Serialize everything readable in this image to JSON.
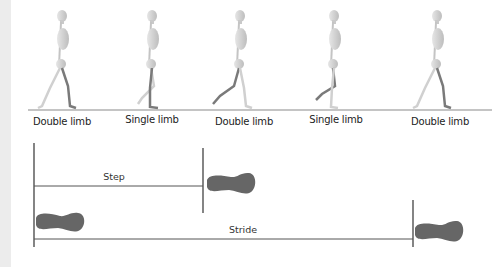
{
  "diagram": {
    "phases": [
      {
        "label": "Double limb",
        "x": 62
      },
      {
        "label": "Single limb",
        "x": 152
      },
      {
        "label": "Double limb",
        "x": 244
      },
      {
        "label": "Single limb",
        "x": 336
      },
      {
        "label": "Double limb",
        "x": 440
      }
    ],
    "measurements": {
      "step": {
        "label": "Step"
      },
      "stride": {
        "label": "Stride"
      }
    },
    "colors": {
      "bone": "#d9d9d9",
      "bone_shade": "#b8b8b8",
      "highlight_leg": "#7a7a7a",
      "ground": "#8a8a8a",
      "line": "#333333",
      "footprint": "#666666"
    }
  }
}
